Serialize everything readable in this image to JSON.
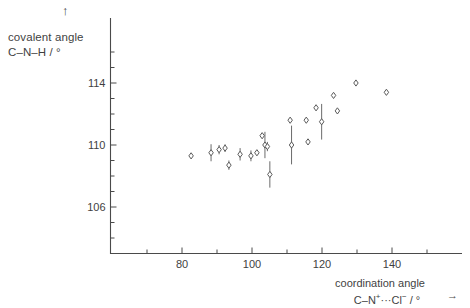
{
  "figure": {
    "y_axis_label_line1": "covalent angle",
    "y_axis_label_line2": "C–N–H / °",
    "x_axis_label_line1": "coordination angle",
    "x_axis_label_line2_pre": "C–N",
    "x_axis_label_line2_sup1": "+",
    "x_axis_label_line2_mid": "···Cl",
    "x_axis_label_line2_sup2": "−",
    "x_axis_label_line2_post": " / °",
    "y_axis_arrow": "↑",
    "x_axis_arrow": "→",
    "marker_color": "#5a5a5a",
    "error_bar_color": "#6b6b6b",
    "axis_color": "#4a4a4a",
    "background_color": "#ffffff"
  },
  "chart_data": {
    "type": "scatter",
    "title": "",
    "xlabel": "coordination angle C–N⁺···Cl⁻ / °",
    "ylabel": "covalent angle C–N–H / °",
    "xlim": [
      68,
      152
    ],
    "ylim": [
      103.2,
      116.6
    ],
    "xticks_major": [
      80,
      100,
      120,
      140
    ],
    "xticks_minor": [
      70,
      90,
      110,
      130,
      150
    ],
    "yticks_major": [
      106,
      110,
      114
    ],
    "yticks_minor": [
      104,
      105,
      107,
      108,
      109,
      111,
      112,
      113,
      115,
      116
    ],
    "grid": false,
    "legend": null,
    "error_bars": "vertical",
    "marker": "open-diamond",
    "points": [
      {
        "x": 82.6,
        "y": 109.3,
        "yerr": 0.0
      },
      {
        "x": 88.3,
        "y": 109.5,
        "yerr": 0.55
      },
      {
        "x": 90.6,
        "y": 109.7,
        "yerr": 0.3
      },
      {
        "x": 92.3,
        "y": 109.8,
        "yerr": 0.25
      },
      {
        "x": 93.4,
        "y": 108.7,
        "yerr": 0.3
      },
      {
        "x": 96.6,
        "y": 109.4,
        "yerr": 0.4
      },
      {
        "x": 99.7,
        "y": 109.3,
        "yerr": 0.35
      },
      {
        "x": 101.4,
        "y": 109.5,
        "yerr": 0.0
      },
      {
        "x": 102.9,
        "y": 110.6,
        "yerr": 0.0
      },
      {
        "x": 103.7,
        "y": 110.0,
        "yerr": 0.85
      },
      {
        "x": 104.4,
        "y": 109.9,
        "yerr": 0.3
      },
      {
        "x": 105.1,
        "y": 108.1,
        "yerr": 0.85
      },
      {
        "x": 110.9,
        "y": 111.6,
        "yerr": 0.0
      },
      {
        "x": 111.3,
        "y": 110.0,
        "yerr": 1.25
      },
      {
        "x": 115.5,
        "y": 111.6,
        "yerr": 0.0
      },
      {
        "x": 116.0,
        "y": 110.2,
        "yerr": 0.0
      },
      {
        "x": 118.3,
        "y": 112.4,
        "yerr": 0.0
      },
      {
        "x": 119.9,
        "y": 111.5,
        "yerr": 1.15
      },
      {
        "x": 123.3,
        "y": 113.2,
        "yerr": 0.0
      },
      {
        "x": 124.4,
        "y": 112.2,
        "yerr": 0.0
      },
      {
        "x": 129.7,
        "y": 114.0,
        "yerr": 0.0
      },
      {
        "x": 138.4,
        "y": 113.4,
        "yerr": 0.0
      }
    ]
  }
}
